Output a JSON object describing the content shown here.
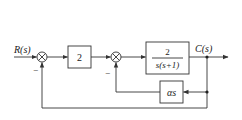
{
  "diagram": {
    "type": "control-system-block-diagram",
    "input_label": "R(s)",
    "output_label": "C(s)",
    "blocks": [
      {
        "id": "gain",
        "label": "2"
      },
      {
        "id": "plant",
        "numerator": "2",
        "denominator": "s(s+1)"
      },
      {
        "id": "rate_feedback",
        "label": "αs"
      }
    ],
    "summing_junctions": [
      {
        "id": "sum1",
        "feedback_sign": "−"
      },
      {
        "id": "sum2",
        "feedback_sign": "−"
      }
    ],
    "line_color": "#333333"
  }
}
